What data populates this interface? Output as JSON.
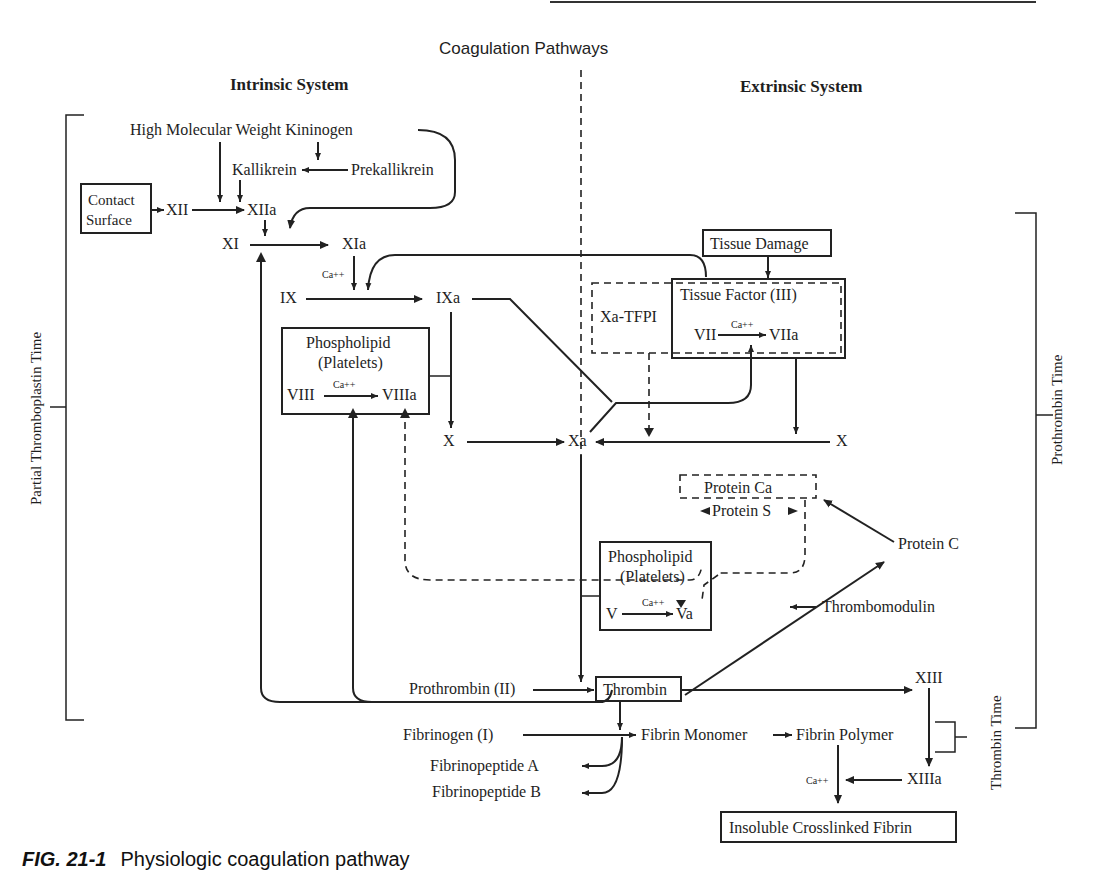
{
  "title": "Coagulation Pathways",
  "sections": {
    "intrinsic": "Intrinsic System",
    "extrinsic": "Extrinsic System"
  },
  "nodes": {
    "hmwk": "High Molecular Weight Kininogen",
    "kallikrein": "Kallikrein",
    "prekallikrein": "Prekallikrein",
    "contact_surface_line1": "Contact",
    "contact_surface_line2": "Surface",
    "xii": "XII",
    "xiia": "XIIa",
    "xi": "XI",
    "xia": "XIa",
    "ca_1": "Ca++",
    "ix": "IX",
    "ixa": "IXa",
    "phospholipid_1_line1": "Phospholipid",
    "phospholipid_1_line2": "(Platelets)",
    "viii": "VIII",
    "ca_2": "Ca++",
    "viiia": "VIIIa",
    "x_left": "X",
    "xa": "Xa",
    "x_right": "X",
    "tissue_damage": "Tissue Damage",
    "tissue_factor": "Tissue Factor (III)",
    "xa_tfpi": "Xa-TFPI",
    "vii": "VII",
    "ca_3": "Ca++",
    "viia": "VIIa",
    "protein_ca": "Protein Ca",
    "protein_s": "Protein S",
    "protein_c": "Protein C",
    "phospholipid_2_line1": "Phospholipid",
    "phospholipid_2_line2": "(Platelets)",
    "v": "V",
    "ca_4": "Ca++",
    "va": "Va",
    "thrombomodulin": "Thrombomodulin",
    "prothrombin": "Prothrombin (II)",
    "thrombin": "Thrombin",
    "xiii": "XIII",
    "xiiia": "XIIIa",
    "ca_5": "Ca++",
    "fibrinogen": "Fibrinogen (I)",
    "fibrin_monomer": "Fibrin Monomer",
    "fibrin_polymer": "Fibrin Polymer",
    "fibrinopeptide_a": "Fibrinopeptide A",
    "fibrinopeptide_b": "Fibrinopeptide B",
    "insoluble_fibrin": "Insoluble Crosslinked Fibrin"
  },
  "brackets": {
    "ptt": "Partial Thromboplastin Time",
    "pt": "Prothrombin Time",
    "tt": "Thrombin Time"
  },
  "caption": {
    "fig": "FIG. 21-1",
    "text": "Physiologic coagulation pathway"
  }
}
